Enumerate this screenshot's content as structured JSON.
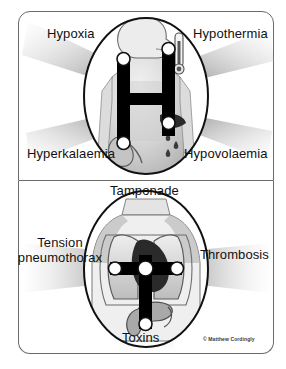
{
  "poster": {
    "title": "Reversible causes of cardiac arrest (4 Hs and 4 Ts)",
    "copyright": "© Matthew Cordingly",
    "colors": {
      "frame_border": "#6b6b6b",
      "text": "#111111",
      "background": "#ffffff",
      "node_fill": "#ffffff",
      "letter_fill": "#000000",
      "beam_gray": "#9a9a9a",
      "body_fill": "#d8d8d8"
    }
  },
  "panels": [
    {
      "id": "four-hs",
      "letter": "H",
      "anatomy": "head-and-torso-silhouette",
      "labels": [
        {
          "id": "hypoxia",
          "text": "Hypoxia",
          "position": "top-left",
          "icon": "lungs-icon"
        },
        {
          "id": "hypothermia",
          "text": "Hypothermia",
          "position": "top-right",
          "icon": "thermometer-icon"
        },
        {
          "id": "hyperkalaemia",
          "text": "Hyperkalaemia",
          "position": "bottom-left",
          "icon": "kidney-icon"
        },
        {
          "id": "hypovolaemia",
          "text": "Hypovolaemia",
          "position": "bottom-right",
          "icon": "blood-drops-icon"
        }
      ]
    },
    {
      "id": "four-ts",
      "letter": "T",
      "anatomy": "chest-lungs-heart-stomach",
      "labels": [
        {
          "id": "tamponade",
          "text": "Tamponade",
          "position": "top",
          "icon": "heart-icon"
        },
        {
          "id": "tension-pneumothorax",
          "text": "Tension pneumothorax",
          "line1": "Tension",
          "line2": "pneumothorax",
          "position": "left",
          "icon": "lung-icon"
        },
        {
          "id": "thrombosis",
          "text": "Thrombosis",
          "position": "right",
          "icon": "lung-icon"
        },
        {
          "id": "toxins",
          "text": "Toxins",
          "position": "bottom",
          "icon": "stomach-icon"
        }
      ]
    }
  ]
}
